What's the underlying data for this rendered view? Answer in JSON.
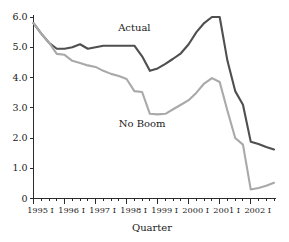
{
  "chart_data": {
    "type": "line",
    "title": "",
    "xlabel": "Quarter",
    "ylabel": "",
    "ylim": [
      0,
      6.0
    ],
    "grid": false,
    "legend_position": "inline-annotation",
    "y_ticks": [
      "0",
      "1.0",
      "2.0",
      "3.0",
      "4.0",
      "5.0",
      "6.0"
    ],
    "y_tick_values": [
      0,
      1.0,
      2.0,
      3.0,
      4.0,
      5.0,
      6.0
    ],
    "x_tick_labels": [
      "1995 I",
      "1996 I",
      "1997 I",
      "1998 I",
      "1999 I",
      "2000 I",
      "2001 I",
      "2002 I"
    ],
    "x_major_tick_index": [
      0,
      4,
      8,
      12,
      16,
      20,
      24,
      28
    ],
    "x_minor_tick_count": 32,
    "x": [
      "1995 I",
      "1995 II",
      "1995 III",
      "1995 IV",
      "1996 I",
      "1996 II",
      "1996 III",
      "1996 IV",
      "1997 I",
      "1997 II",
      "1997 III",
      "1997 IV",
      "1998 I",
      "1998 II",
      "1998 III",
      "1998 IV",
      "1999 I",
      "1999 II",
      "1999 III",
      "1999 IV",
      "2000 I",
      "2000 II",
      "2000 III",
      "2000 IV",
      "2001 I",
      "2001 II",
      "2001 III",
      "2001 IV",
      "2002 I",
      "2002 II",
      "2002 III",
      "2002 IV"
    ],
    "series": [
      {
        "name": "Actual",
        "color": "#4f4f4f",
        "label_x_index": 13,
        "label_y_value": 5.55,
        "values": [
          5.8,
          5.45,
          5.15,
          4.95,
          4.95,
          5.0,
          5.1,
          4.95,
          5.0,
          5.05,
          5.05,
          5.05,
          5.05,
          5.05,
          4.7,
          4.22,
          4.3,
          4.45,
          4.62,
          4.8,
          5.1,
          5.5,
          5.8,
          6.0,
          6.0,
          4.55,
          3.55,
          3.1,
          1.88,
          1.8,
          1.7,
          1.62
        ]
      },
      {
        "name": "No Boom",
        "color": "#a9a9a9",
        "label_x_index": 14,
        "label_y_value": 2.35,
        "values": [
          5.8,
          5.45,
          5.15,
          4.78,
          4.75,
          4.55,
          4.48,
          4.4,
          4.35,
          4.22,
          4.12,
          4.05,
          3.95,
          3.55,
          3.52,
          2.8,
          2.78,
          2.8,
          2.95,
          3.1,
          3.25,
          3.5,
          3.8,
          3.98,
          3.85,
          2.9,
          2.0,
          1.78,
          0.3,
          0.35,
          0.42,
          0.52
        ]
      }
    ]
  },
  "labels": {
    "axis_title_x": "Quarter",
    "series_actual": "Actual",
    "series_noboom": "No Boom"
  }
}
